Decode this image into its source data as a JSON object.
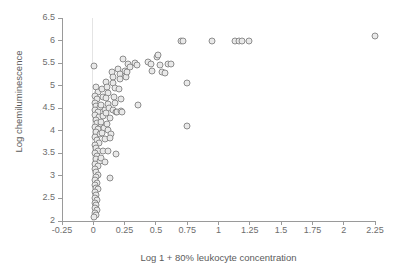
{
  "chart_data": {
    "type": "scatter",
    "title": "",
    "xlabel": "Log 1 + 80% leukocyte concentration",
    "ylabel": "Log chemiluminescence",
    "xlim": [
      -0.25,
      2.25
    ],
    "ylim": [
      2,
      6.5
    ],
    "xticks": [
      -0.25,
      0,
      0.25,
      0.5,
      0.75,
      1,
      1.25,
      1.5,
      1.75,
      2,
      2.25
    ],
    "xtick_labels": [
      "-0.25",
      "0",
      "0.25",
      "0.5",
      "0.75",
      "1",
      "1.25",
      "1.5",
      "1.75",
      "2",
      "2.25"
    ],
    "yticks": [
      2,
      2.5,
      3,
      3.5,
      4,
      4.5,
      5,
      5.5,
      6,
      6.5
    ],
    "ytick_labels": [
      "2",
      "2.5",
      "3",
      "3.5",
      "4",
      "4.5",
      "5",
      "5.5",
      "6",
      "6.5"
    ],
    "grid": false,
    "legend": "none",
    "marker": {
      "shape": "circle",
      "fill_color": "#e9e9e9",
      "edge_color": "#8d8d8d",
      "size_px": 7
    },
    "series": [
      {
        "name": "samples",
        "points": [
          [
            0.005,
            5.43
          ],
          [
            0.02,
            4.98
          ],
          [
            0.04,
            4.86
          ],
          [
            0.015,
            4.78
          ],
          [
            0.03,
            4.7
          ],
          [
            0.01,
            4.62
          ],
          [
            0.025,
            4.55
          ],
          [
            0.05,
            4.52
          ],
          [
            0.015,
            4.46
          ],
          [
            0.035,
            4.41
          ],
          [
            0.01,
            4.35
          ],
          [
            0.045,
            4.3
          ],
          [
            0.02,
            4.24
          ],
          [
            0.03,
            4.18
          ],
          [
            0.06,
            4.14
          ],
          [
            0.015,
            4.09
          ],
          [
            0.04,
            4.03
          ],
          [
            0.02,
            3.97
          ],
          [
            0.05,
            3.92
          ],
          [
            0.01,
            3.86
          ],
          [
            0.03,
            3.8
          ],
          [
            0.045,
            3.74
          ],
          [
            0.015,
            3.68
          ],
          [
            0.025,
            3.62
          ],
          [
            0.04,
            3.56
          ],
          [
            0.01,
            3.5
          ],
          [
            0.03,
            3.44
          ],
          [
            0.02,
            3.38
          ],
          [
            0.05,
            3.33
          ],
          [
            0.015,
            3.27
          ],
          [
            0.035,
            3.21
          ],
          [
            0.01,
            3.15
          ],
          [
            0.025,
            3.09
          ],
          [
            0.04,
            3.03
          ],
          [
            0.02,
            2.97
          ],
          [
            0.01,
            2.91
          ],
          [
            0.03,
            2.85
          ],
          [
            0.015,
            2.79
          ],
          [
            0.02,
            2.73
          ],
          [
            0.04,
            2.7
          ],
          [
            0.01,
            2.64
          ],
          [
            0.025,
            2.58
          ],
          [
            0.015,
            2.52
          ],
          [
            0.03,
            2.47
          ],
          [
            0.01,
            2.41
          ],
          [
            0.02,
            2.35
          ],
          [
            0.015,
            2.29
          ],
          [
            0.03,
            2.24
          ],
          [
            0.01,
            2.18
          ],
          [
            0.02,
            2.13
          ],
          [
            0.005,
            2.08
          ],
          [
            0.07,
            4.92
          ],
          [
            0.08,
            4.74
          ],
          [
            0.06,
            4.58
          ],
          [
            0.09,
            4.47
          ],
          [
            0.075,
            4.33
          ],
          [
            0.065,
            4.2
          ],
          [
            0.085,
            4.07
          ],
          [
            0.07,
            3.95
          ],
          [
            0.095,
            3.82
          ],
          [
            0.08,
            3.55
          ],
          [
            0.06,
            3.4
          ],
          [
            0.09,
            3.3
          ],
          [
            0.1,
            5.08
          ],
          [
            0.11,
            4.96
          ],
          [
            0.12,
            4.84
          ],
          [
            0.105,
            4.72
          ],
          [
            0.115,
            4.6
          ],
          [
            0.125,
            4.5
          ],
          [
            0.1,
            4.4
          ],
          [
            0.13,
            4.29
          ],
          [
            0.11,
            4.16
          ],
          [
            0.12,
            4.02
          ],
          [
            0.14,
            3.93
          ],
          [
            0.13,
            3.83
          ],
          [
            0.12,
            3.55
          ],
          [
            0.135,
            2.96
          ],
          [
            0.15,
            5.3
          ],
          [
            0.16,
            5.19
          ],
          [
            0.155,
            5.06
          ],
          [
            0.17,
            4.95
          ],
          [
            0.165,
            4.74
          ],
          [
            0.175,
            4.62
          ],
          [
            0.16,
            4.45
          ],
          [
            0.18,
            4.42
          ],
          [
            0.19,
            4.41
          ],
          [
            0.185,
            3.48
          ],
          [
            0.2,
            5.36
          ],
          [
            0.21,
            5.25
          ],
          [
            0.215,
            5.14
          ],
          [
            0.205,
            4.93
          ],
          [
            0.22,
            4.7
          ],
          [
            0.225,
            4.44
          ],
          [
            0.23,
            4.42
          ],
          [
            0.24,
            5.6
          ],
          [
            0.25,
            5.33
          ],
          [
            0.255,
            5.22
          ],
          [
            0.26,
            5.19
          ],
          [
            0.27,
            5.3
          ],
          [
            0.28,
            5.47
          ],
          [
            0.29,
            5.41
          ],
          [
            0.33,
            5.5
          ],
          [
            0.35,
            5.45
          ],
          [
            0.36,
            4.57
          ],
          [
            0.44,
            5.52
          ],
          [
            0.46,
            5.49
          ],
          [
            0.47,
            5.33
          ],
          [
            0.51,
            5.64
          ],
          [
            0.52,
            5.68
          ],
          [
            0.53,
            5.46
          ],
          [
            0.55,
            5.3
          ],
          [
            0.57,
            5.27
          ],
          [
            0.6,
            5.49
          ],
          [
            0.62,
            5.48
          ],
          [
            0.7,
            6.0
          ],
          [
            0.72,
            6.0
          ],
          [
            0.75,
            5.07
          ],
          [
            0.75,
            4.1
          ],
          [
            0.95,
            5.99
          ],
          [
            1.13,
            6.0
          ],
          [
            1.16,
            6.0
          ],
          [
            1.19,
            6.0
          ],
          [
            1.24,
            6.0
          ],
          [
            2.25,
            6.09
          ]
        ]
      }
    ]
  }
}
